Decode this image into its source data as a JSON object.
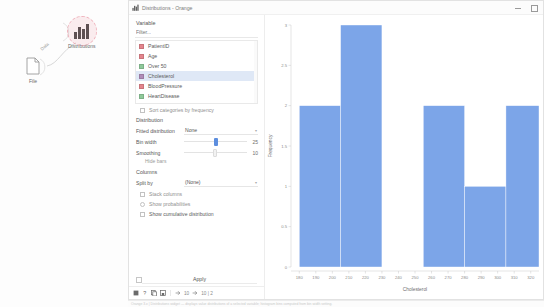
{
  "canvas": {
    "nodes": [
      {
        "id": "file",
        "label": "File",
        "icon": "document-icon"
      },
      {
        "id": "distributions",
        "label": "Distributions",
        "icon": "bar-chart-icon"
      }
    ],
    "link_label": "Data"
  },
  "window": {
    "title": "Distributions - Orange",
    "icon": "bar-chart-icon",
    "minimize_label": "Minimize",
    "maximize_label": "Maximize"
  },
  "controls": {
    "variable_group": "Variable",
    "filter_placeholder": "Filter...",
    "variables": [
      {
        "label": "PatientID",
        "color": "#e4848c",
        "selected": false
      },
      {
        "label": "Age",
        "color": "#e4848c",
        "selected": false
      },
      {
        "label": "Over 50",
        "color": "#8fc99a",
        "selected": false
      },
      {
        "label": "Cholesterol",
        "color": "#b08bb8",
        "selected": true
      },
      {
        "label": "BloodPressure",
        "color": "#e4848c",
        "selected": false
      },
      {
        "label": "HeartDisease",
        "color": "#8fc99a",
        "selected": false
      }
    ],
    "sort_categories_label": "Sort categories by frequency",
    "distribution_group": "Distribution",
    "fitted_distribution_label": "Fitted distribution",
    "fitted_distribution_value": "None",
    "bin_width_label": "Bin width",
    "bin_width_value": "25",
    "smoothing_label": "Smoothing",
    "smoothing_value": "10",
    "hide_bars_label": "Hide bars",
    "columns_group": "Columns",
    "split_by_label": "Split by",
    "split_by_value": "(None)",
    "stack_columns_label": "Stack columns",
    "show_probabilities_label": "Show probabilities",
    "show_cumulative_label": "Show cumulative distribution",
    "apply_label": "Apply",
    "accent_color": "#5d8ede"
  },
  "statusbar": {
    "icons": [
      "report-icon",
      "help-icon",
      "copy-icon",
      "save-image-icon"
    ],
    "input_count": "10",
    "output_count": "10 | 2"
  },
  "chart_data": {
    "type": "bar",
    "title": "",
    "xlabel": "Cholesterol",
    "ylabel": "Frequency",
    "grid": false,
    "legend": "none",
    "bar_color": "#7ca5e8",
    "xlim": [
      175,
      325
    ],
    "ylim": [
      0,
      3
    ],
    "yticks": [
      0,
      0.5,
      1,
      1.5,
      2,
      2.5,
      3
    ],
    "ytick_labels": [
      "0",
      "0.5",
      "1",
      "1.5",
      "2",
      "2.5",
      "3"
    ],
    "xticks": [
      180,
      190,
      200,
      210,
      220,
      230,
      240,
      250,
      260,
      270,
      280,
      290,
      300,
      310,
      320
    ],
    "xtick_labels": [
      "180",
      "190",
      "200",
      "210",
      "220",
      "230",
      "240",
      "250",
      "260",
      "270",
      "280",
      "290",
      "300",
      "310",
      "320"
    ],
    "bin_width": 25,
    "bins": [
      {
        "x0": 180,
        "x1": 205,
        "value": 2
      },
      {
        "x0": 205,
        "x1": 230,
        "value": 3
      },
      {
        "x0": 230,
        "x1": 255,
        "value": 0
      },
      {
        "x0": 255,
        "x1": 280,
        "value": 2
      },
      {
        "x0": 280,
        "x1": 305,
        "value": 1
      },
      {
        "x0": 305,
        "x1": 325,
        "value": 2
      }
    ]
  },
  "bottom_strip": {
    "text": "Orange 3.x  |  Distributions widget  —  displays value distributions of a selected variable; histogram bins computed from bin width setting."
  }
}
